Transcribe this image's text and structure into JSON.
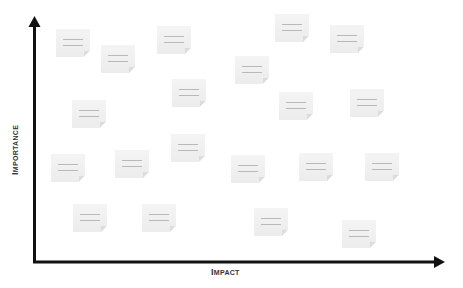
{
  "diagram": {
    "type": "2x2-style prioritization plot",
    "x_axis": {
      "label_first": "I",
      "label_rest": "MPACT",
      "label": "Impact"
    },
    "y_axis": {
      "label_first": "I",
      "label_rest": "MPORTANCE",
      "label": "Importance"
    },
    "colors": {
      "axis": "#111111",
      "note_bg": "#efefef",
      "note_line": "#b9b9b9",
      "background": "#ffffff"
    },
    "notes": [
      {
        "id": 1,
        "x": 56,
        "y": 29
      },
      {
        "id": 2,
        "x": 101,
        "y": 45
      },
      {
        "id": 3,
        "x": 157,
        "y": 26
      },
      {
        "id": 4,
        "x": 275,
        "y": 14
      },
      {
        "id": 5,
        "x": 330,
        "y": 25
      },
      {
        "id": 6,
        "x": 235,
        "y": 56
      },
      {
        "id": 7,
        "x": 172,
        "y": 79
      },
      {
        "id": 8,
        "x": 72,
        "y": 100
      },
      {
        "id": 9,
        "x": 279,
        "y": 92
      },
      {
        "id": 10,
        "x": 350,
        "y": 89
      },
      {
        "id": 11,
        "x": 171,
        "y": 134
      },
      {
        "id": 12,
        "x": 51,
        "y": 154
      },
      {
        "id": 13,
        "x": 115,
        "y": 150
      },
      {
        "id": 14,
        "x": 231,
        "y": 155
      },
      {
        "id": 15,
        "x": 299,
        "y": 153
      },
      {
        "id": 16,
        "x": 365,
        "y": 153
      },
      {
        "id": 17,
        "x": 73,
        "y": 204
      },
      {
        "id": 18,
        "x": 142,
        "y": 204
      },
      {
        "id": 19,
        "x": 254,
        "y": 208
      },
      {
        "id": 20,
        "x": 342,
        "y": 220
      }
    ]
  }
}
